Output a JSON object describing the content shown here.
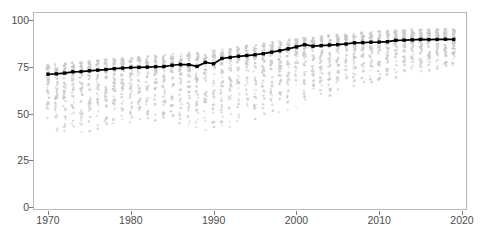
{
  "chart_data": {
    "type": "line",
    "title": "",
    "subtitle": "",
    "xlabel": "",
    "ylabel": "",
    "xlim": [
      1968.2,
      2021.0
    ],
    "ylim": [
      -3,
      104
    ],
    "grid": false,
    "legend": false,
    "legend_position": "none",
    "x_ticks": [
      1970,
      1980,
      1990,
      2000,
      2010,
      2020
    ],
    "x_tick_labels": [
      "1970",
      "1980",
      "1990",
      "2000",
      "2010",
      "2020"
    ],
    "y_ticks": [
      0,
      25,
      50,
      75,
      100
    ],
    "y_tick_labels": [
      "0",
      "25",
      "50",
      "75",
      "100"
    ],
    "colors": {
      "line": "#000000",
      "marker": "#000000",
      "scatter": "#c8c8c8",
      "panel_border": "#b8b8b8",
      "axis_text": "#4d4d4d",
      "background": "#ffffff"
    },
    "series": [
      {
        "name": "mean",
        "type": "line",
        "marker": "square",
        "x": [
          1970,
          1971,
          1972,
          1973,
          1974,
          1975,
          1976,
          1977,
          1978,
          1979,
          1980,
          1981,
          1982,
          1983,
          1984,
          1985,
          1986,
          1987,
          1988,
          1989,
          1990,
          1991,
          1992,
          1993,
          1994,
          1995,
          1996,
          1997,
          1998,
          1999,
          2000,
          2001,
          2002,
          2003,
          2004,
          2005,
          2006,
          2007,
          2008,
          2009,
          2010,
          2011,
          2012,
          2013,
          2014,
          2015,
          2016,
          2017,
          2018,
          2019
        ],
        "values": [
          71.0,
          71.2,
          71.6,
          72.3,
          72.4,
          72.8,
          73.2,
          73.5,
          74.0,
          74.3,
          74.6,
          74.7,
          74.8,
          75.0,
          75.1,
          75.8,
          76.2,
          76.1,
          75.2,
          77.3,
          76.6,
          79.4,
          80.0,
          80.6,
          81.0,
          81.4,
          82.0,
          82.8,
          83.6,
          84.6,
          85.6,
          86.8,
          86.0,
          86.3,
          86.6,
          86.8,
          87.2,
          87.8,
          87.9,
          88.1,
          88.2,
          88.4,
          89.1,
          89.2,
          89.4,
          89.6,
          89.5,
          89.6,
          89.7,
          89.6
        ]
      },
      {
        "name": "countries",
        "type": "scatter",
        "description": "one grey point per country per year",
        "x_range": [
          1970,
          2019
        ],
        "value_range": [
          36,
          95
        ],
        "lower_bound_by_year": {
          "1970": 37,
          "1975": 40,
          "1980": 45,
          "1985": 46,
          "1989": 41,
          "1992": 42,
          "1995": 47,
          "2000": 53,
          "2005": 60,
          "2010": 67,
          "2015": 72,
          "2019": 75
        },
        "upper_bound_by_year": {
          "1970": 76,
          "1975": 78,
          "1980": 80,
          "1985": 82,
          "1989": 83,
          "1992": 85,
          "1995": 87,
          "2000": 90,
          "2005": 92,
          "2010": 94,
          "2015": 95,
          "2019": 95
        }
      }
    ]
  },
  "footnote": {
    "text": ""
  }
}
